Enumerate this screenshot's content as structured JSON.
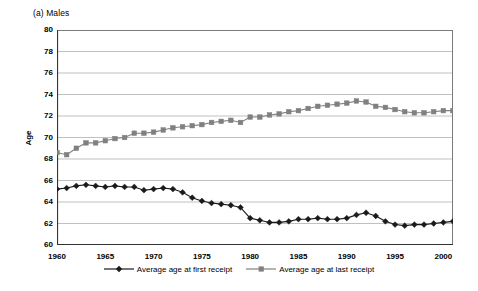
{
  "chart_data": {
    "type": "line",
    "title": "(a) Males",
    "xlabel": "",
    "ylabel": "Age",
    "xlim": [
      1960,
      2001
    ],
    "ylim": [
      60,
      80
    ],
    "ytick_step": 2,
    "yticks": [
      60,
      62,
      64,
      66,
      68,
      70,
      72,
      74,
      76,
      78,
      80
    ],
    "xticks": [
      1960,
      1965,
      1970,
      1975,
      1980,
      1985,
      1990,
      1995,
      2000
    ],
    "x": [
      1960,
      1961,
      1962,
      1963,
      1964,
      1965,
      1966,
      1967,
      1968,
      1969,
      1970,
      1971,
      1972,
      1973,
      1974,
      1975,
      1976,
      1977,
      1978,
      1979,
      1980,
      1981,
      1982,
      1983,
      1984,
      1985,
      1986,
      1987,
      1988,
      1989,
      1990,
      1991,
      1992,
      1993,
      1994,
      1995,
      1996,
      1997,
      1998,
      1999,
      2000,
      2001
    ],
    "grid": true,
    "grid_axis": "y",
    "legend_position": "bottom",
    "series": [
      {
        "name": "Average age at first receipt",
        "marker": "diamond",
        "color": "#1a1a1a",
        "values": [
          65.2,
          65.3,
          65.5,
          65.6,
          65.5,
          65.4,
          65.5,
          65.4,
          65.4,
          65.1,
          65.2,
          65.3,
          65.2,
          64.9,
          64.4,
          64.1,
          63.9,
          63.8,
          63.7,
          63.5,
          62.5,
          62.3,
          62.1,
          62.1,
          62.2,
          62.4,
          62.4,
          62.5,
          62.4,
          62.4,
          62.5,
          62.8,
          63.0,
          62.7,
          62.2,
          61.9,
          61.8,
          61.9,
          61.9,
          62.0,
          62.1,
          62.2
        ]
      },
      {
        "name": "Average age at last receipt",
        "marker": "square",
        "color": "#808080",
        "values": [
          68.6,
          68.4,
          69.0,
          69.5,
          69.5,
          69.7,
          69.9,
          70.0,
          70.4,
          70.4,
          70.5,
          70.7,
          70.9,
          71.0,
          71.1,
          71.2,
          71.4,
          71.5,
          71.6,
          71.4,
          71.9,
          71.9,
          72.1,
          72.2,
          72.4,
          72.5,
          72.7,
          72.9,
          73.0,
          73.1,
          73.2,
          73.4,
          73.3,
          72.9,
          72.8,
          72.6,
          72.4,
          72.3,
          72.3,
          72.4,
          72.5,
          72.5
        ]
      }
    ]
  },
  "legend": {
    "items": [
      {
        "label": "Average age at first receipt",
        "marker": "diamond",
        "color": "#1a1a1a"
      },
      {
        "label": "Average age at last receipt",
        "marker": "square",
        "color": "#808080"
      }
    ]
  }
}
